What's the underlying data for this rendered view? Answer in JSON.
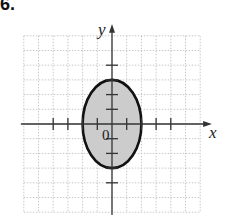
{
  "problem": {
    "number_label": "6."
  },
  "graph": {
    "x_axis_label": "x",
    "y_axis_label": "y",
    "origin_label": "0",
    "grid": {
      "x_min": -6,
      "x_max": 6,
      "y_min": -6,
      "y_max": 6,
      "step": 1,
      "style": "dotted",
      "color": "#c8c8c8"
    },
    "ticks": {
      "x": [
        -4,
        -3,
        -2,
        -1,
        1,
        2,
        3,
        4
      ],
      "y": [
        -4,
        -3,
        -2,
        -1,
        1,
        2,
        3,
        4
      ]
    }
  },
  "chart_data": {
    "type": "region",
    "title": "",
    "xlabel": "x",
    "ylabel": "y",
    "xlim": [
      -6,
      6
    ],
    "ylim": [
      -6,
      6
    ],
    "grid": true,
    "shapes": [
      {
        "kind": "ellipse",
        "center": [
          0,
          0
        ],
        "semi_axis_x": 2,
        "semi_axis_y": 3,
        "boundary": "solid",
        "fill": "#cccccc",
        "stroke": "#111111",
        "equation": "x^2/4 + y^2/9 <= 1"
      }
    ]
  }
}
